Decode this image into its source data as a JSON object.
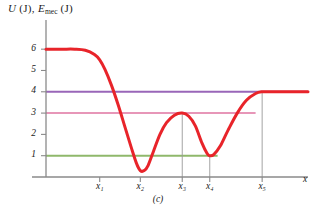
{
  "figure": {
    "caption": "(c)",
    "axis_title_u": "U",
    "axis_title_u_unit": "(J),",
    "axis_title_e": "E",
    "axis_title_e_sub": "mec",
    "axis_title_e_unit": "(J)",
    "xaxis_name": "x"
  },
  "chart_data": {
    "type": "line",
    "xlabel": "x",
    "ylabel": "U (J), E_mec (J)",
    "ylim": [
      0,
      6.9
    ],
    "xlim": [
      0,
      1
    ],
    "grid": false,
    "legend": "none",
    "y_ticks": [
      1,
      2,
      3,
      4,
      5,
      6
    ],
    "y_tick_labels": [
      "1",
      "2",
      "3",
      "4",
      "5",
      "6"
    ],
    "x_ticks": [
      0.205,
      0.36,
      0.52,
      0.625,
      0.825
    ],
    "x_tick_labels": [
      "x1",
      "x2",
      "x3",
      "x4",
      "x5"
    ],
    "x_tick_labels_display": [
      "x₁",
      "x₂",
      "x₃",
      "x₄",
      "x₅"
    ],
    "series": [
      {
        "name": "U(x) potential energy curve",
        "color": "#e8242a",
        "width": 3,
        "points": [
          [
            0.0,
            6.0
          ],
          [
            0.06,
            6.0
          ],
          [
            0.11,
            6.0
          ],
          [
            0.15,
            5.95
          ],
          [
            0.185,
            5.75
          ],
          [
            0.205,
            5.5
          ],
          [
            0.225,
            5.05
          ],
          [
            0.25,
            4.3
          ],
          [
            0.275,
            3.4
          ],
          [
            0.3,
            2.4
          ],
          [
            0.325,
            1.4
          ],
          [
            0.345,
            0.65
          ],
          [
            0.36,
            0.3
          ],
          [
            0.375,
            0.3
          ],
          [
            0.39,
            0.55
          ],
          [
            0.41,
            1.2
          ],
          [
            0.435,
            2.0
          ],
          [
            0.46,
            2.55
          ],
          [
            0.49,
            2.9
          ],
          [
            0.52,
            3.0
          ],
          [
            0.545,
            2.85
          ],
          [
            0.57,
            2.4
          ],
          [
            0.595,
            1.6
          ],
          [
            0.615,
            1.1
          ],
          [
            0.625,
            1.0
          ],
          [
            0.64,
            1.05
          ],
          [
            0.665,
            1.45
          ],
          [
            0.695,
            2.2
          ],
          [
            0.73,
            3.0
          ],
          [
            0.765,
            3.6
          ],
          [
            0.8,
            3.92
          ],
          [
            0.825,
            4.0
          ],
          [
            0.87,
            4.0
          ],
          [
            0.93,
            4.0
          ],
          [
            1.0,
            4.0
          ]
        ]
      }
    ],
    "reference_lines": [
      {
        "name": "mechanical-energy-4J",
        "value": 4,
        "color": "#9966b8",
        "x_start": 0.0,
        "x_end": 1.0,
        "width": 2
      },
      {
        "name": "mechanical-energy-3J",
        "value": 3,
        "color": "#e796b8",
        "x_start": 0.0,
        "x_end": 0.8,
        "width": 2
      },
      {
        "name": "mechanical-energy-1J",
        "value": 1,
        "color": "#8fb86b",
        "x_start": 0.0,
        "x_end": 0.655,
        "width": 2
      }
    ],
    "drop_lines": [
      {
        "name": "dropline-x3",
        "x": 0.52,
        "y_top": 3.0
      },
      {
        "name": "dropline-x4",
        "x": 0.625,
        "y_top": 1.0
      },
      {
        "name": "dropline-x5",
        "x": 0.825,
        "y_top": 4.0
      }
    ],
    "annotations": []
  }
}
